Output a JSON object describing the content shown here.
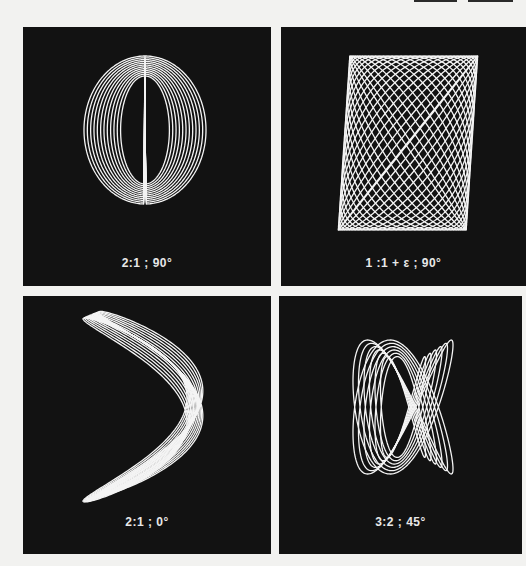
{
  "page": {
    "background": "#f2f2f0",
    "panel_color": "#121212",
    "trace_color": "#f4f4f4"
  },
  "top_bars": [
    {
      "x": 414,
      "width": 43
    },
    {
      "x": 468,
      "width": 45
    }
  ],
  "panels": [
    {
      "id": "p1",
      "caption": "2:1 ; 90°",
      "ratio": "2:1",
      "phase_deg": 90,
      "box": {
        "x": 23,
        "y": 27,
        "w": 248,
        "h": 259
      },
      "caption_y": 229,
      "figure": {
        "type": "bowtie",
        "cx": 122,
        "cy": 103,
        "ax": 61,
        "ay": 74,
        "count": 12,
        "shrink": 0.6
      }
    },
    {
      "id": "p2",
      "caption": "1 :1 + ε ; 90°",
      "ratio": "1:1+ε",
      "phase_deg": 90,
      "box": {
        "x": 281,
        "y": 27,
        "w": 245,
        "h": 259
      },
      "caption_y": 229,
      "figure": {
        "type": "ellipses",
        "cx": 127,
        "cy": 116,
        "ax": 64,
        "ay": 87,
        "count": 22,
        "tilt": 0.22
      }
    },
    {
      "id": "p3",
      "caption": "2:1 ; 0°",
      "ratio": "2:1",
      "phase_deg": 0,
      "box": {
        "x": 23,
        "y": 296,
        "w": 248,
        "h": 258
      },
      "caption_y": 219,
      "figure": {
        "type": "chevron",
        "cx": 122,
        "cy": 114,
        "ax": 52,
        "ay": 92,
        "count": 13
      }
    },
    {
      "id": "p4",
      "caption": "3:2 ; 45°",
      "ratio": "3:2",
      "phase_deg": 45,
      "box": {
        "x": 279,
        "y": 296,
        "w": 243,
        "h": 258
      },
      "caption_y": 219,
      "figure": {
        "type": "lissajous32",
        "cx": 124,
        "cy": 111,
        "ax": 50,
        "ay": 67,
        "count": 6
      }
    }
  ]
}
